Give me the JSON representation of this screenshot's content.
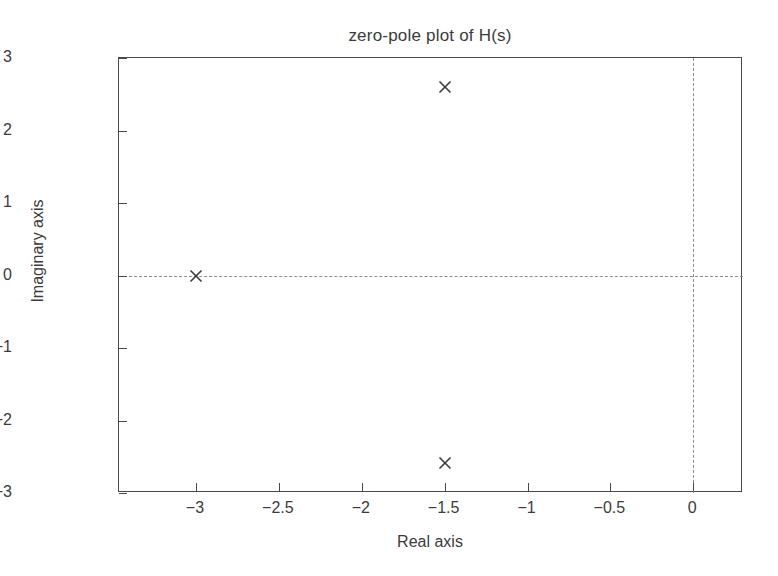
{
  "chart_data": {
    "type": "scatter",
    "title": "zero-pole plot of H(s)",
    "xlabel": "Real axis",
    "ylabel": "Imaginary axis",
    "xlim": [
      -3.4645,
      0.3
    ],
    "ylim": [
      -3,
      3
    ],
    "grid": false,
    "legend": null,
    "xticks": [
      -3,
      -2.5,
      -2,
      -1.5,
      -1,
      -0.5,
      0
    ],
    "xticklabels": [
      "−3",
      "−2.5",
      "−2",
      "−1.5",
      "−1",
      "−0.5",
      "0"
    ],
    "yticks": [
      -3,
      -2,
      -1,
      0,
      1,
      2,
      3
    ],
    "yticklabels": [
      "−3",
      "−2",
      "−1",
      "0",
      "1",
      "2",
      "3"
    ],
    "reference_lines": [
      {
        "name": "imaginary-zero-line",
        "orientation": "horizontal",
        "value": 0,
        "style": "dashed"
      },
      {
        "name": "real-zero-line",
        "orientation": "vertical",
        "value": 0,
        "style": "dashed"
      }
    ],
    "series": [
      {
        "name": "poles",
        "marker": "x",
        "color": "#3a3a3a",
        "points": [
          {
            "label": "pole-upper",
            "x": -1.5,
            "y": 2.6
          },
          {
            "label": "pole-real",
            "x": -3.0,
            "y": 0.0
          },
          {
            "label": "pole-lower",
            "x": -1.5,
            "y": -2.58
          }
        ]
      }
    ]
  }
}
